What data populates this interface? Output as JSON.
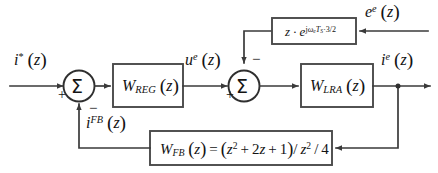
{
  "diagram": {
    "colors": {
      "line": "#3a3a3a",
      "box_border": "#4a4a4a",
      "box_fill": "#ffffff",
      "text": "#131313",
      "background": "#ffffff"
    },
    "signals": {
      "reference_input": "i*(z)",
      "regulator_output": "ue(z)",
      "plant_output": "ie(z)",
      "feedback_signal": "iFB(z)",
      "disturbance_input": "ee(z)"
    },
    "blocks": {
      "regulator": "WREG(z)",
      "plant": "WLRA(z)",
      "delay": "z·ejωeTS·3/2",
      "feedback": "WFB(z)=(z2+2z+1)/z2/4"
    },
    "summers": {
      "first": {
        "glyph": "Σ",
        "input_sign": "+",
        "feedback_sign": "−"
      },
      "second": {
        "glyph": "Σ",
        "input_sign": "+",
        "disturbance_sign": "−"
      }
    }
  }
}
